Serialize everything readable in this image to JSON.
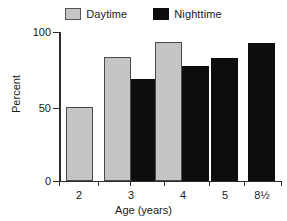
{
  "chart_data": {
    "type": "bar",
    "title": "",
    "xlabel": "Age (years)",
    "ylabel": "Percent",
    "categories": [
      "2",
      "3",
      "4",
      "5",
      "8½"
    ],
    "series": [
      {
        "name": "Daytime",
        "color": "#c5c5c5",
        "values": [
          50,
          84,
          94,
          null,
          null
        ]
      },
      {
        "name": "Nighttime",
        "color": "#0d0d0d",
        "values": [
          null,
          69,
          78,
          83,
          93
        ]
      }
    ],
    "ylim": [
      0,
      100
    ],
    "yticks": [
      0,
      50,
      100
    ],
    "ytick_labels": [
      "0",
      "50",
      "100"
    ],
    "grid": false,
    "legend_position": "top-center"
  },
  "legend": {
    "entries": [
      {
        "label": "Daytime",
        "swatch": "daytime-swatch"
      },
      {
        "label": "Nighttime",
        "swatch": "nighttime-swatch"
      }
    ]
  },
  "axes": {
    "y_title": "Percent",
    "x_title": "Age (years)",
    "y_tick_labels": [
      "100",
      "50",
      "0"
    ],
    "x_tick_labels": [
      "2",
      "3",
      "4",
      "5",
      "8½"
    ]
  },
  "colors": {
    "daytime": "#c5c5c5",
    "nighttime": "#0d0d0d",
    "axis": "#2b2b2b",
    "text": "#1a1a1a",
    "background": "#ffffff"
  }
}
